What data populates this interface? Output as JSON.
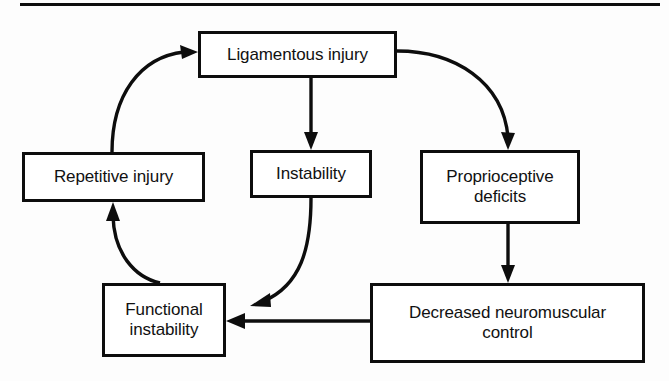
{
  "figure": {
    "background_color": "#fdfdfd",
    "line_color": "#0d0d0d",
    "text_color": "#111111",
    "top_rule": true
  },
  "nodes": [
    {
      "id": "ligamentous",
      "label": "Ligamentous injury",
      "x": 198,
      "y": 31,
      "w": 199,
      "h": 47
    },
    {
      "id": "repetitive",
      "label": "Repetitive injury",
      "x": 22,
      "y": 152,
      "w": 183,
      "h": 50
    },
    {
      "id": "instability",
      "label": "Instability",
      "x": 250,
      "y": 150,
      "w": 122,
      "h": 48
    },
    {
      "id": "proprio",
      "label": "Proprioceptive\ndeficits",
      "x": 420,
      "y": 150,
      "w": 160,
      "h": 74
    },
    {
      "id": "functional",
      "label": "Functional\ninstability",
      "x": 102,
      "y": 283,
      "w": 124,
      "h": 74
    },
    {
      "id": "decreased",
      "label": "Decreased neuromuscular\ncontrol",
      "x": 370,
      "y": 283,
      "w": 275,
      "h": 80
    }
  ],
  "edges": [
    {
      "id": "repetitive-to-ligamentous",
      "from": "repetitive",
      "to": "ligamentous",
      "style": "curved"
    },
    {
      "id": "ligamentous-to-instability",
      "from": "ligamentous",
      "to": "instability",
      "style": "straight"
    },
    {
      "id": "ligamentous-to-proprio",
      "from": "ligamentous",
      "to": "proprio",
      "style": "curved"
    },
    {
      "id": "instability-to-functional",
      "from": "instability",
      "to": "functional",
      "style": "curved"
    },
    {
      "id": "proprio-to-decreased",
      "from": "proprio",
      "to": "decreased",
      "style": "straight"
    },
    {
      "id": "decreased-to-functional",
      "from": "decreased",
      "to": "functional",
      "style": "straight"
    },
    {
      "id": "functional-to-repetitive",
      "from": "functional",
      "to": "repetitive",
      "style": "curved"
    }
  ]
}
